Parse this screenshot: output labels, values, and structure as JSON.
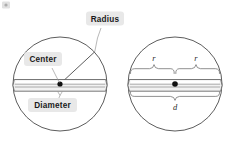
{
  "figure": {
    "background_color": "#ffffff",
    "callout_box_color": "#e8e8e8",
    "callout_text_color": "#1a1a1a",
    "stroke_color": "#4a4a4a",
    "band_fill_color": "#f2f2f2",
    "center_dot_color": "#111111"
  },
  "left_circle": {
    "name": "labeled-circle",
    "callouts": [
      {
        "key": "radius",
        "label": "Radius"
      },
      {
        "key": "center",
        "label": "Center"
      },
      {
        "key": "diameter",
        "label": "Diameter"
      }
    ]
  },
  "right_circle": {
    "name": "variable-circle",
    "labels": [
      {
        "key": "radius_left",
        "label": "r"
      },
      {
        "key": "radius_right",
        "label": "r"
      },
      {
        "key": "diameter",
        "label": "d"
      }
    ]
  }
}
